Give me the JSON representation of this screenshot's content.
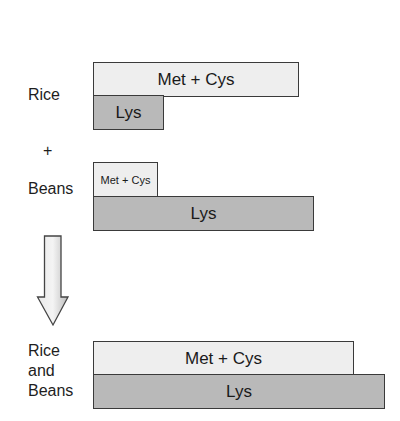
{
  "diagram": {
    "rice": {
      "label": "Rice",
      "bars": [
        {
          "name": "Met + Cys",
          "label": "Met + Cys",
          "relative_amount": 205
        },
        {
          "name": "Lys",
          "label": "Lys",
          "relative_amount": 70
        }
      ]
    },
    "plus": {
      "label": "+"
    },
    "beans": {
      "label": "Beans",
      "bars": [
        {
          "name": "Met + Cys",
          "label": "Met + Cys",
          "relative_amount": 64
        },
        {
          "name": "Lys",
          "label": "Lys",
          "relative_amount": 220
        }
      ]
    },
    "arrow": {
      "direction": "down"
    },
    "combined": {
      "label_line1": "Rice",
      "label_line2": "and",
      "label_line3": "Beans",
      "bars": [
        {
          "name": "Met + Cys",
          "label": "Met + Cys",
          "relative_amount": 260
        },
        {
          "name": "Lys",
          "label": "Lys",
          "relative_amount": 291
        }
      ]
    },
    "colors": {
      "met_cys_fill": "#eeeeee",
      "lys_fill": "#b9b9b9",
      "border": "#3a3a3a",
      "arrow_fill": "#cccccc"
    }
  }
}
